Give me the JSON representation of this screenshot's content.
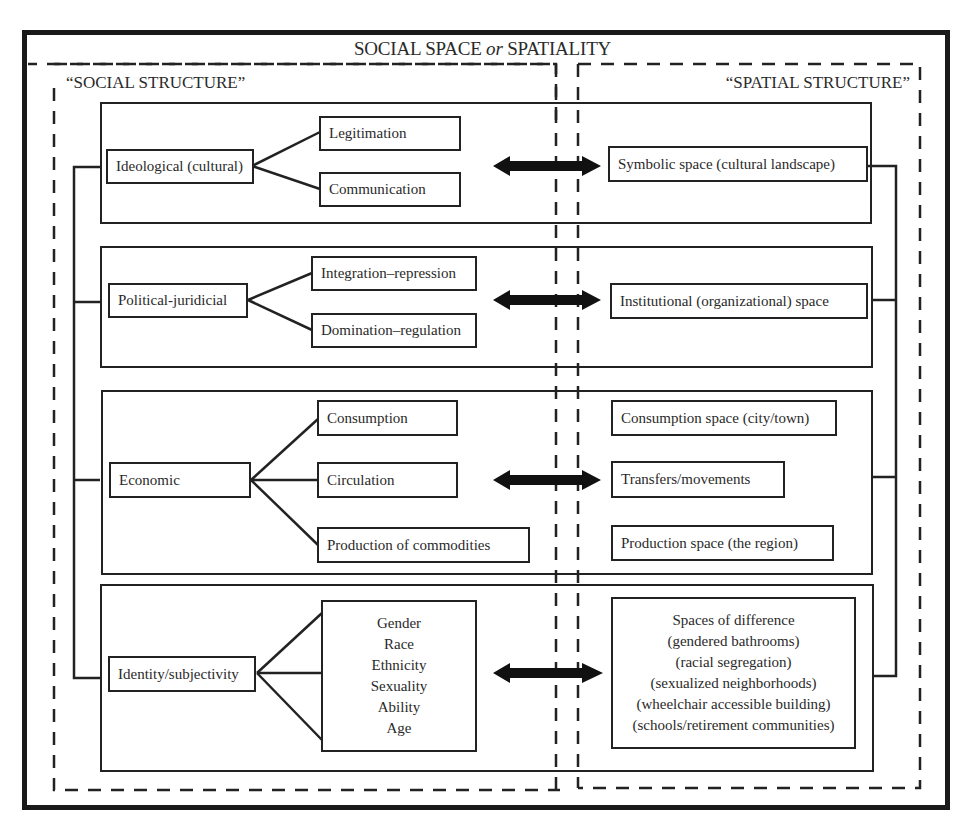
{
  "title": {
    "part1": "SOCIAL SPACE ",
    "connector": "or",
    "part2": " SPATIALITY"
  },
  "left_section_label": "“SOCIAL STRUCTURE”",
  "right_section_label": "“SPATIAL STRUCTURE”",
  "rows": [
    {
      "social": "Ideological (cultural)",
      "sub": [
        "Legitimation",
        "Communication"
      ],
      "spatial": [
        "Symbolic space (cultural landscape)"
      ]
    },
    {
      "social": "Political-juridicial",
      "sub": [
        "Integration–repression",
        "Domination–regulation"
      ],
      "spatial": [
        "Institutional (organizational) space"
      ]
    },
    {
      "social": "Economic",
      "sub": [
        "Consumption",
        "Circulation",
        "Production of commodities"
      ],
      "spatial": [
        "Consumption space (city/town)",
        "Transfers/movements",
        "Production space (the region)"
      ]
    },
    {
      "social": "Identity/subjectivity",
      "sub": [
        "Gender",
        "Race",
        "Ethnicity",
        "Sexuality",
        "Ability",
        "Age"
      ],
      "spatial": [
        "Spaces of difference",
        "(gendered bathrooms)",
        "(racial segregation)",
        "(sexualized neighborhoods)",
        "(wheelchair accessible building)",
        "(schools/retirement communities)"
      ]
    }
  ],
  "arrow_icon": "double-headed-arrow"
}
